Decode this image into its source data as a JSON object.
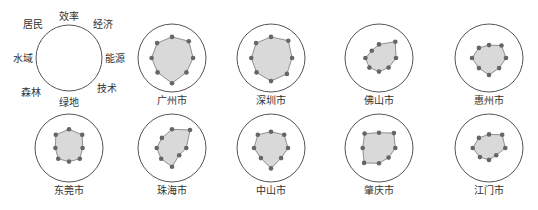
{
  "chart_data": {
    "type": "radar",
    "title": "",
    "axes": [
      "效率",
      "经济",
      "能源",
      "技术",
      "绿地",
      "森林",
      "水域",
      "居民"
    ],
    "range": [
      0,
      1
    ],
    "grid": false,
    "legend": {
      "placement": "top-left",
      "description": "Axis orientation key"
    },
    "colors": {
      "outline": "#555555",
      "fill": "#d9d9d9",
      "polygon_stroke": "#777777",
      "point": "#666666",
      "text": "#333333"
    },
    "series": [
      {
        "name": "广州市",
        "values": [
          0.62,
          0.7,
          0.62,
          0.6,
          0.74,
          0.6,
          0.6,
          0.62
        ]
      },
      {
        "name": "深圳市",
        "values": [
          0.62,
          0.72,
          0.62,
          0.66,
          0.68,
          0.6,
          0.58,
          0.62
        ]
      },
      {
        "name": "佛山市",
        "values": [
          0.4,
          0.68,
          0.5,
          0.4,
          0.4,
          0.4,
          0.4,
          0.3
        ]
      },
      {
        "name": "惠州市",
        "values": [
          0.38,
          0.52,
          0.5,
          0.42,
          0.5,
          0.42,
          0.5,
          0.42
        ]
      },
      {
        "name": "东莞市",
        "values": [
          0.55,
          0.55,
          0.4,
          0.45,
          0.4,
          0.45,
          0.4,
          0.55
        ]
      },
      {
        "name": "珠海市",
        "values": [
          0.55,
          0.75,
          0.42,
          0.3,
          0.55,
          0.45,
          0.45,
          0.42
        ]
      },
      {
        "name": "中山市",
        "values": [
          0.48,
          0.55,
          0.5,
          0.42,
          0.6,
          0.42,
          0.5,
          0.55
        ]
      },
      {
        "name": "肇庆市",
        "values": [
          0.45,
          0.62,
          0.48,
          0.4,
          0.45,
          0.62,
          0.48,
          0.6
        ]
      },
      {
        "name": "江门市",
        "values": [
          0.4,
          0.55,
          0.48,
          0.3,
          0.35,
          0.38,
          0.48,
          0.42
        ]
      }
    ]
  }
}
